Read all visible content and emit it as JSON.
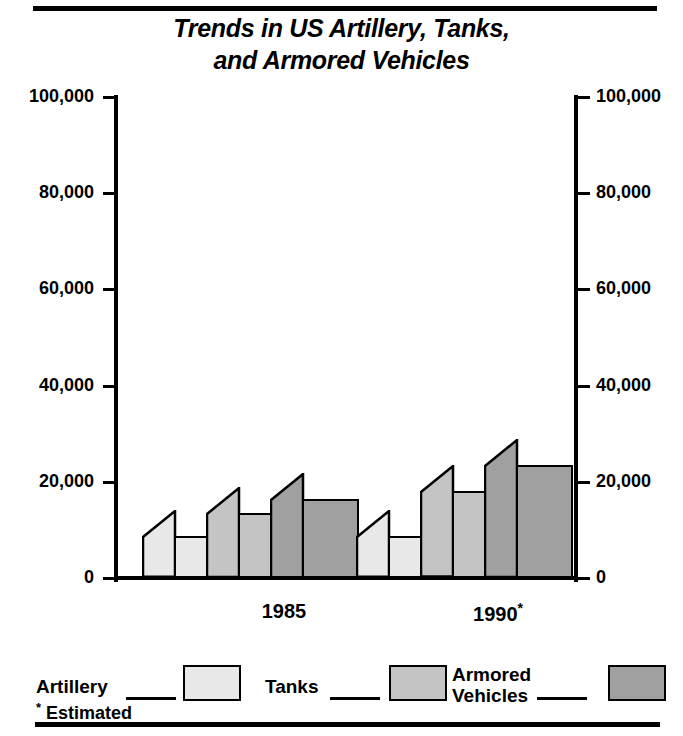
{
  "chart_data": {
    "type": "bar",
    "title": "Trends in US Artillery, Tanks, and Armored Vehicles",
    "title_line1": "Trends in US Artillery, Tanks,",
    "title_line2": "and Armored Vehicles",
    "xlabel": "",
    "ylabel": "",
    "ylim": [
      0,
      100000
    ],
    "grid": false,
    "legend_position": "bottom",
    "categories": [
      "1985",
      "1990*"
    ],
    "tick_labels": [
      "0",
      "20,000",
      "40,000",
      "60,000",
      "80,000",
      "100,000"
    ],
    "tick_values": [
      0,
      20000,
      40000,
      60000,
      80000,
      100000
    ],
    "series": [
      {
        "name": "Artillery",
        "values": [
          8700,
          8700
        ],
        "color": "#e8e8e8"
      },
      {
        "name": "Tanks",
        "values": [
          13500,
          18000
        ],
        "color": "#c4c4c4"
      },
      {
        "name": "Armored Vehicles",
        "values": [
          16500,
          23500
        ],
        "color": "#a0a0a0"
      }
    ],
    "annotations": [
      "* Estimated"
    ]
  },
  "axes": {
    "left_labels": [
      "100,000",
      "80,000",
      "60,000",
      "40,000",
      "20,000",
      "0"
    ],
    "right_labels": [
      "100,000",
      "80,000",
      "60,000",
      "40,000",
      "20,000",
      "0"
    ]
  },
  "groups": [
    {
      "label": "1985",
      "suffix": ""
    },
    {
      "label": "1990",
      "suffix": "*"
    }
  ],
  "legend": {
    "items": [
      {
        "label": "Artillery",
        "label_line2": "",
        "color": "#e8e8e8"
      },
      {
        "label": "Tanks",
        "label_line2": "",
        "color": "#c4c4c4"
      },
      {
        "label": "Armored",
        "label_line2": "Vehicles",
        "color": "#a0a0a0"
      }
    ]
  },
  "footnote": {
    "marker": "*",
    "text": "Estimated"
  }
}
